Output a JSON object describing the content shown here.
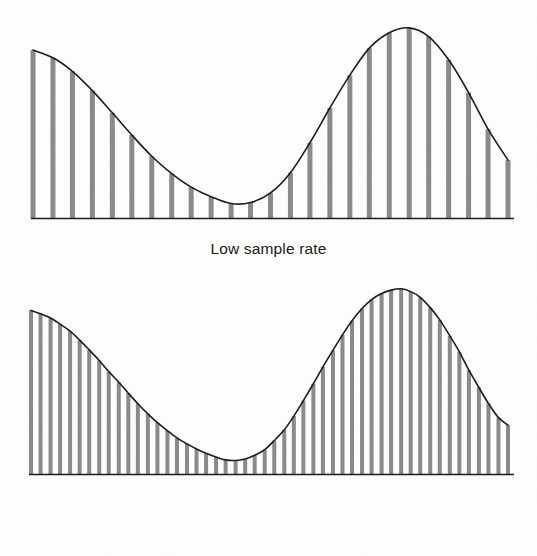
{
  "figure": {
    "title": "",
    "background_color": "#fdfdfb",
    "ink_color": "#1c1c1c",
    "bar_color": "#8a8a8a"
  },
  "panels": [
    {
      "id": "low",
      "caption": "Low sample rate"
    },
    {
      "id": "high",
      "caption": "High sample rate"
    }
  ],
  "chart_data": [
    {
      "type": "bar",
      "title": "Low sample rate",
      "subtitle": "",
      "xlabel": "",
      "ylabel": "",
      "grid": false,
      "legend": null,
      "annotations": [],
      "description": "Continuous waveform (two-hump curve) overlaid with widely spaced vertical sample bars; bar heights equal the curve value at each sample position.",
      "n_samples": 25,
      "xlim": [
        0,
        1
      ],
      "ylim": [
        0,
        1
      ],
      "x": [
        0.0,
        0.042,
        0.083,
        0.125,
        0.167,
        0.208,
        0.25,
        0.292,
        0.333,
        0.375,
        0.417,
        0.458,
        0.5,
        0.542,
        0.583,
        0.625,
        0.667,
        0.708,
        0.75,
        0.792,
        0.833,
        0.875,
        0.917,
        0.958,
        1.0
      ],
      "values": [
        0.87,
        0.83,
        0.76,
        0.66,
        0.545,
        0.43,
        0.32,
        0.23,
        0.16,
        0.11,
        0.075,
        0.08,
        0.13,
        0.235,
        0.39,
        0.57,
        0.74,
        0.88,
        0.96,
        0.985,
        0.94,
        0.82,
        0.65,
        0.46,
        0.3
      ],
      "categories": [
        "s1",
        "s2",
        "s3",
        "s4",
        "s5",
        "s6",
        "s7",
        "s8",
        "s9",
        "s10",
        "s11",
        "s12",
        "s13",
        "s14",
        "s15",
        "s16",
        "s17",
        "s18",
        "s19",
        "s20",
        "s21",
        "s22",
        "s23",
        "s24",
        "s25"
      ],
      "bar_width_px": 5,
      "bar_spacing_px": 19.8,
      "series": [
        {
          "name": "continuous waveform",
          "kind": "line"
        },
        {
          "name": "samples",
          "kind": "bar"
        }
      ]
    },
    {
      "type": "bar",
      "title": "High sample rate",
      "subtitle": "",
      "xlabel": "",
      "ylabel": "",
      "grid": false,
      "legend": null,
      "annotations": [],
      "description": "Same continuous waveform sampled at roughly twice the density; vertical sample bars are packed close together and trace the curve more faithfully.",
      "n_samples": 50,
      "xlim": [
        0,
        1
      ],
      "ylim": [
        0,
        1
      ],
      "x": [
        0.0,
        0.02,
        0.041,
        0.061,
        0.082,
        0.102,
        0.122,
        0.143,
        0.163,
        0.184,
        0.204,
        0.224,
        0.245,
        0.265,
        0.286,
        0.306,
        0.327,
        0.347,
        0.367,
        0.388,
        0.408,
        0.429,
        0.449,
        0.469,
        0.49,
        0.51,
        0.531,
        0.551,
        0.571,
        0.592,
        0.612,
        0.633,
        0.653,
        0.673,
        0.694,
        0.714,
        0.735,
        0.755,
        0.776,
        0.796,
        0.816,
        0.837,
        0.857,
        0.878,
        0.898,
        0.918,
        0.939,
        0.959,
        0.98,
        1.0
      ],
      "values": [
        0.87,
        0.852,
        0.83,
        0.797,
        0.76,
        0.712,
        0.66,
        0.604,
        0.545,
        0.488,
        0.43,
        0.374,
        0.32,
        0.273,
        0.23,
        0.192,
        0.16,
        0.133,
        0.11,
        0.09,
        0.075,
        0.072,
        0.08,
        0.1,
        0.13,
        0.178,
        0.235,
        0.308,
        0.39,
        0.48,
        0.57,
        0.658,
        0.74,
        0.815,
        0.88,
        0.928,
        0.96,
        0.978,
        0.985,
        0.97,
        0.94,
        0.885,
        0.82,
        0.735,
        0.65,
        0.552,
        0.46,
        0.375,
        0.3,
        0.26
      ],
      "categories": [
        "t1",
        "t2",
        "t3",
        "t4",
        "t5",
        "t6",
        "t7",
        "t8",
        "t9",
        "t10",
        "t11",
        "t12",
        "t13",
        "t14",
        "t15",
        "t16",
        "t17",
        "t18",
        "t19",
        "t20",
        "t21",
        "t22",
        "t23",
        "t24",
        "t25",
        "t26",
        "t27",
        "t28",
        "t29",
        "t30",
        "t31",
        "t32",
        "t33",
        "t34",
        "t35",
        "t36",
        "t37",
        "t38",
        "t39",
        "t40",
        "t41",
        "t42",
        "t43",
        "t44",
        "t45",
        "t46",
        "t47",
        "t48",
        "t49",
        "t50"
      ],
      "bar_width_px": 4,
      "bar_spacing_px": 9.7,
      "series": [
        {
          "name": "continuous waveform",
          "kind": "line"
        },
        {
          "name": "samples",
          "kind": "bar"
        }
      ]
    }
  ]
}
